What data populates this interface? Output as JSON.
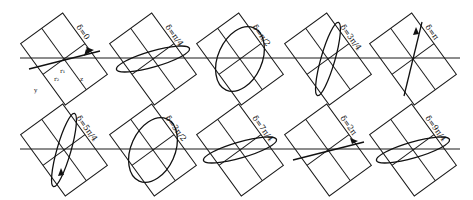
{
  "figure": {
    "axis_labels": {
      "y": "y",
      "z": "z",
      "r1": "r₁",
      "r2": "r₂"
    },
    "rows": [
      {
        "panels": [
          {
            "label": "δ=0",
            "shape": "line"
          },
          {
            "label": "δ=π/4",
            "shape": "ellipse"
          },
          {
            "label": "δ=π/2",
            "shape": "ellipse-upright"
          },
          {
            "label": "δ=3π/4",
            "shape": "ellipse"
          },
          {
            "label": "δ=π",
            "shape": "line"
          }
        ]
      },
      {
        "panels": [
          {
            "label": "δ=5π/4",
            "shape": "ellipse"
          },
          {
            "label": "δ=3π/2",
            "shape": "ellipse-upright"
          },
          {
            "label": "δ=7π/4",
            "shape": "ellipse"
          },
          {
            "label": "δ=2π",
            "shape": "line"
          },
          {
            "label": "δ=9π/4",
            "shape": "ellipse"
          }
        ]
      }
    ]
  }
}
